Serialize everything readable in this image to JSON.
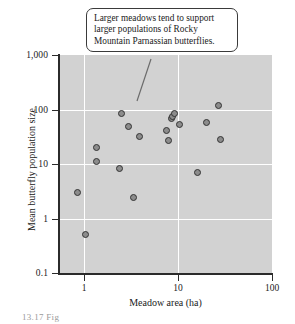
{
  "figure": {
    "background_color": "#ffffff",
    "panel_color": "#d2d2d2",
    "grid_color": "#ffffff",
    "marker_fill": "#8c8c8c",
    "marker_edge": "#333333",
    "caption_scrap": "13.17  Fig"
  },
  "callout": {
    "text": "Larger meadows tend to support larger populations of Rocky Mountain Parnassian butterflies."
  },
  "chart_data": {
    "type": "scatter",
    "title": "",
    "xlabel": "Meadow area (ha)",
    "ylabel": "Mean butterfly population size",
    "xscale": "log",
    "yscale": "log",
    "xlim": [
      0.5,
      100
    ],
    "ylim": [
      0.1,
      1000
    ],
    "grid": true,
    "legend": "none",
    "xticks": [
      1,
      10,
      100
    ],
    "xticklabels": [
      "1",
      "10",
      "100"
    ],
    "yticks": [
      0.1,
      1,
      10,
      100,
      1000
    ],
    "yticklabels": [
      "0.1",
      "1",
      "10",
      "100",
      "1,000"
    ],
    "annotations": [
      {
        "text": "Larger meadows tend to support larger populations of Rocky Mountain Parnassian butterflies.",
        "points_to": [
          3.5,
          110
        ]
      }
    ],
    "points": [
      {
        "x": 0.85,
        "y": 3.0
      },
      {
        "x": 1.05,
        "y": 0.5
      },
      {
        "x": 1.35,
        "y": 20.0
      },
      {
        "x": 1.35,
        "y": 11.0
      },
      {
        "x": 2.5,
        "y": 85.0
      },
      {
        "x": 2.4,
        "y": 8.2
      },
      {
        "x": 3.0,
        "y": 48.0
      },
      {
        "x": 3.4,
        "y": 2.4
      },
      {
        "x": 3.9,
        "y": 32.0
      },
      {
        "x": 7.6,
        "y": 41.0
      },
      {
        "x": 7.9,
        "y": 27.0
      },
      {
        "x": 8.6,
        "y": 68.0
      },
      {
        "x": 8.8,
        "y": 73.0
      },
      {
        "x": 9.1,
        "y": 84.0
      },
      {
        "x": 10.5,
        "y": 52.0
      },
      {
        "x": 16.0,
        "y": 7.0
      },
      {
        "x": 20.0,
        "y": 58.0
      },
      {
        "x": 27.0,
        "y": 120.0
      },
      {
        "x": 28.0,
        "y": 28.0
      }
    ]
  }
}
